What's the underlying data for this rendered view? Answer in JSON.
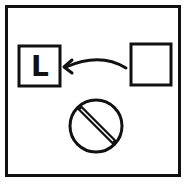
{
  "diagram": {
    "title": "",
    "target_box": {
      "label": "L"
    },
    "source_box": {
      "label": ""
    },
    "arrow": {
      "from": "source_box",
      "to": "target_box",
      "direction": "right-to-left"
    },
    "symbol": {
      "name": "prohibition-sign"
    },
    "colors": {
      "stroke": "#111111",
      "background": "#ffffff"
    }
  }
}
